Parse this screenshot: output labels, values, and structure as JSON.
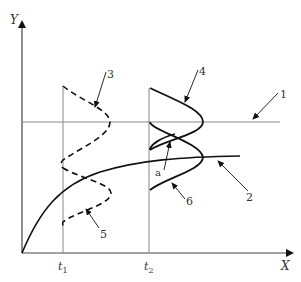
{
  "figure": {
    "axes": {
      "y_label": "Y",
      "x_label": "X",
      "x_ticks": [
        {
          "label": "t",
          "subscript": "1"
        },
        {
          "label": "t",
          "subscript": "2"
        }
      ]
    },
    "callouts": [
      {
        "id": "1",
        "label": "1",
        "target": "horizontal-reference-line"
      },
      {
        "id": "2",
        "label": "2",
        "target": "trend-curve"
      },
      {
        "id": "3",
        "label": "3",
        "target": "upper-dashed-distribution-t1"
      },
      {
        "id": "4",
        "label": "4",
        "target": "upper-solid-distribution-t2"
      },
      {
        "id": "5",
        "label": "5",
        "target": "lower-dashed-distribution-t1"
      },
      {
        "id": "6",
        "label": "6",
        "target": "lower-solid-distribution-t2"
      },
      {
        "id": "a",
        "label": "a",
        "target": "intersection-point-t2"
      }
    ],
    "colors": {
      "axis": "#444444",
      "thin_line": "#888888",
      "curve": "#111111",
      "text": "#333333",
      "background": "#ffffff"
    }
  }
}
